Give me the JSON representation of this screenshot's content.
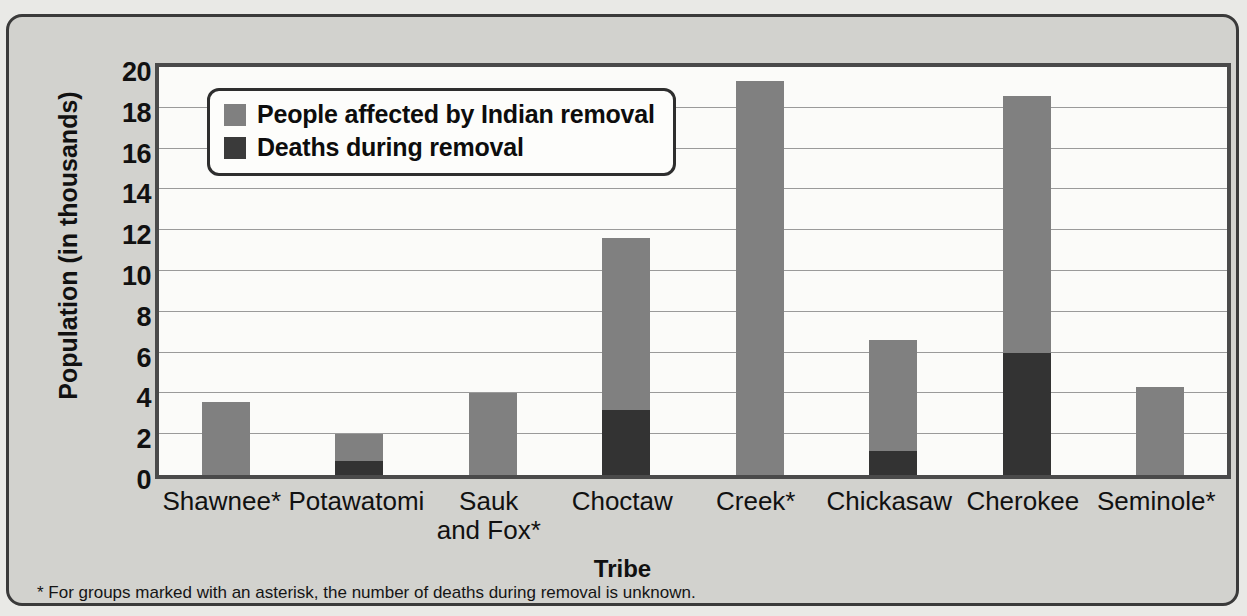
{
  "figure": {
    "footnote": "* For groups marked with an asterisk, the number of deaths during removal is unknown.",
    "colors": {
      "affected": "#808080",
      "deaths": "#333333",
      "panel_background": "#d2d2ce",
      "plot_background": "#fbfbf9",
      "frame": "#4a4a4a"
    }
  },
  "legend": {
    "position": "inside-top-left",
    "items": [
      {
        "label": "People affected by Indian removal",
        "swatch": "light-gray-swatch"
      },
      {
        "label": "Deaths during removal",
        "swatch": "dark-gray-swatch"
      }
    ]
  },
  "chart_data": {
    "type": "bar",
    "title": "",
    "subtitle": "",
    "xlabel": "Tribe",
    "ylabel": "Population (in thousands)",
    "ylim": [
      0,
      20
    ],
    "yticks": [
      0,
      2,
      4,
      6,
      8,
      10,
      12,
      14,
      16,
      18,
      20
    ],
    "ytick_labels": [
      "0",
      "2",
      "4",
      "6",
      "8",
      "10",
      "12",
      "14",
      "16",
      "18",
      "20"
    ],
    "grid": "horizontal",
    "stacked": true,
    "categories": [
      "Shawnee*",
      "Potawatomi",
      "Sauk\nand Fox*",
      "Choctaw",
      "Creek*",
      "Chickasaw",
      "Cherokee",
      "Seminole*"
    ],
    "series": [
      {
        "name": "People affected by Indian removal",
        "color": "#808080",
        "values": [
          3.6,
          2.0,
          4.0,
          11.6,
          19.3,
          6.6,
          18.6,
          4.3
        ]
      },
      {
        "name": "Deaths during removal",
        "color": "#333333",
        "values": [
          null,
          0.7,
          null,
          3.2,
          null,
          1.2,
          6.0,
          null
        ]
      }
    ]
  }
}
